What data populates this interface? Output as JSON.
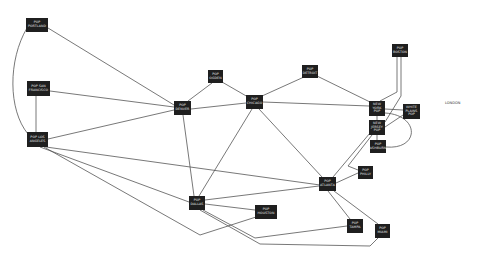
{
  "diagram": {
    "type": "network-topology",
    "nodes": [
      {
        "id": "portland",
        "label": "POP\nPORTLAND",
        "x": 26,
        "y": 18,
        "w": 22,
        "h": 14
      },
      {
        "id": "sf",
        "label": "POP SAN\nFRANCISCO",
        "x": 27,
        "y": 81,
        "w": 23,
        "h": 15
      },
      {
        "id": "la",
        "label": "POP LOS\nANGELES",
        "x": 27,
        "y": 132,
        "w": 21,
        "h": 15
      },
      {
        "id": "denver",
        "label": "POP\nDENVER",
        "x": 174,
        "y": 101,
        "w": 17,
        "h": 14
      },
      {
        "id": "ogden",
        "label": "POP\nOGDEN",
        "x": 208,
        "y": 70,
        "w": 15,
        "h": 13
      },
      {
        "id": "chicago",
        "label": "POP\nCHICAGO",
        "x": 246,
        "y": 95,
        "w": 17,
        "h": 14
      },
      {
        "id": "detroit",
        "label": "POP\nDETROIT",
        "x": 302,
        "y": 65,
        "w": 16,
        "h": 13
      },
      {
        "id": "boston",
        "label": "POP\nBOSTON",
        "x": 392,
        "y": 44,
        "w": 16,
        "h": 13
      },
      {
        "id": "nyc",
        "label": "NEW\nYORK\nPOP",
        "x": 369,
        "y": 101,
        "w": 16,
        "h": 15
      },
      {
        "id": "wp",
        "label": "WHITE\nPLAINS\nPOP",
        "x": 403,
        "y": 104,
        "w": 17,
        "h": 15
      },
      {
        "id": "nj",
        "label": "NEW\nJERSEY\nPOP",
        "x": 369,
        "y": 120,
        "w": 16,
        "h": 15
      },
      {
        "id": "ashburn",
        "label": "POP\nASHBURN",
        "x": 370,
        "y": 140,
        "w": 16,
        "h": 13
      },
      {
        "id": "philly",
        "label": "POP\nPHILLY",
        "x": 358,
        "y": 166,
        "w": 15,
        "h": 13
      },
      {
        "id": "atlanta",
        "label": "POP\nATLANTA",
        "x": 319,
        "y": 177,
        "w": 17,
        "h": 14
      },
      {
        "id": "dallas",
        "label": "POP\nDALLAS",
        "x": 189,
        "y": 196,
        "w": 16,
        "h": 14
      },
      {
        "id": "houston",
        "label": "POP\nHOUSTON",
        "x": 255,
        "y": 205,
        "w": 22,
        "h": 14
      },
      {
        "id": "tampa",
        "label": "POP\nTAMPA",
        "x": 347,
        "y": 219,
        "w": 16,
        "h": 14
      },
      {
        "id": "miami",
        "label": "POP\nMIAMI",
        "x": 375,
        "y": 224,
        "w": 15,
        "h": 14
      }
    ],
    "free_labels": [
      {
        "id": "london",
        "label": "LONDON",
        "x": 445,
        "y": 101
      }
    ],
    "edges": [
      {
        "from": "portland",
        "to": "denver",
        "d": "M48 28 L174 105"
      },
      {
        "from": "portland",
        "to": "la",
        "d": "M27 28 C8 60 8 110 28 134"
      },
      {
        "from": "sf",
        "to": "denver",
        "d": "M50 91 L174 107"
      },
      {
        "from": "sf",
        "to": "la",
        "d": "M36 96 L36 132"
      },
      {
        "from": "la",
        "to": "denver",
        "d": "M48 139 L174 110"
      },
      {
        "from": "la",
        "to": "atlanta",
        "d": "M46 147 L320 185"
      },
      {
        "from": "la",
        "to": "dallas",
        "d": "M40 147 L189 202"
      },
      {
        "from": "denver",
        "to": "ogden",
        "d": "M188 101 L212 83"
      },
      {
        "from": "ogden",
        "to": "chicago",
        "d": "M222 82 L248 97"
      },
      {
        "from": "denver",
        "to": "chicago",
        "d": "M191 109 L246 103"
      },
      {
        "from": "denver",
        "to": "dallas",
        "d": "M183 115 L194 196"
      },
      {
        "from": "chicago",
        "to": "detroit",
        "d": "M262 96 L304 77"
      },
      {
        "from": "chicago",
        "to": "nyc",
        "d": "M263 102 L369 106"
      },
      {
        "from": "chicago",
        "to": "dallas",
        "d": "M252 109 L199 196"
      },
      {
        "from": "chicago",
        "to": "atlanta",
        "d": "M259 109 L322 177"
      },
      {
        "from": "detroit",
        "to": "nyc",
        "d": "M317 76 L370 102"
      },
      {
        "from": "boston",
        "to": "nyc",
        "d": "M397 57 L397 92 L380 101"
      },
      {
        "from": "boston",
        "to": "nj",
        "d": "M401 57 L401 96 L385 122"
      },
      {
        "from": "nyc",
        "to": "wp",
        "d": "M385 109 L403 110"
      },
      {
        "from": "nyc",
        "to": "nj",
        "d": "M377 116 L377 120"
      },
      {
        "from": "nyc",
        "to": "ashburn",
        "d": "M385 113 C420 115 420 150 386 147"
      },
      {
        "from": "wp",
        "to": "nj",
        "d": "M403 115 L385 127"
      },
      {
        "from": "nj",
        "to": "ashburn",
        "d": "M377 135 L377 140"
      },
      {
        "from": "nj",
        "to": "atlanta",
        "d": "M370 133 L333 177"
      },
      {
        "from": "nj",
        "to": "philly",
        "d": "M372 135 L348 166 L358 170"
      },
      {
        "from": "philly",
        "to": "atlanta",
        "d": "M358 173 L336 183"
      },
      {
        "from": "atlanta",
        "to": "dallas",
        "d": "M319 186 L205 200"
      },
      {
        "from": "atlanta",
        "to": "tampa",
        "d": "M328 191 L350 219"
      },
      {
        "from": "atlanta",
        "to": "miami",
        "d": "M334 191 L378 224"
      },
      {
        "from": "dallas",
        "to": "houston",
        "d": "M205 204 L255 210"
      },
      {
        "from": "dallas",
        "to": "tampa",
        "d": "M203 210 L255 238 L347 226"
      },
      {
        "from": "dallas",
        "to": "miami",
        "d": "M200 210 L260 244 L370 246 L378 238"
      },
      {
        "from": "la",
        "to": "houston",
        "d": "M44 147 L200 235 L256 217"
      }
    ]
  }
}
